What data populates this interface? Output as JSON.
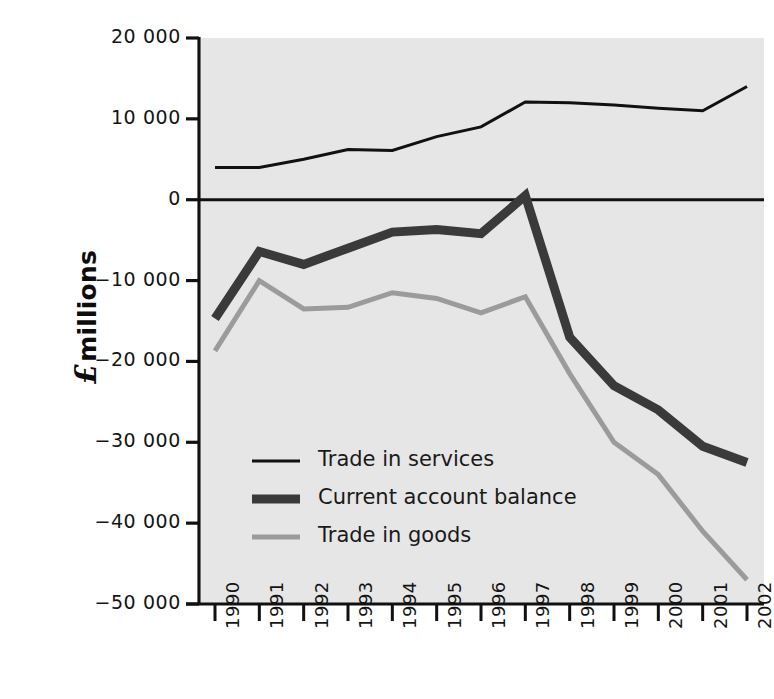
{
  "chart_data": {
    "type": "line",
    "title": "",
    "xlabel": "",
    "ylabel": "£ millions",
    "ylabel_symbol": "£",
    "ylabel_text": "millions",
    "x": [
      "1990",
      "1991",
      "1992",
      "1993",
      "1994",
      "1995",
      "1996",
      "1997",
      "1998",
      "1999",
      "2000",
      "2001",
      "2002"
    ],
    "categories": [
      "1990",
      "1991",
      "1992",
      "1993",
      "1994",
      "1995",
      "1996",
      "1997",
      "1998",
      "1999",
      "2000",
      "2001",
      "2002"
    ],
    "ylim": [
      -50000,
      20000
    ],
    "ytick_values": [
      20000,
      10000,
      0,
      -10000,
      -20000,
      -30000,
      -40000,
      -50000
    ],
    "ytick_labels": [
      "20 000",
      "10 000",
      "0",
      "−10 000",
      "−20 000",
      "−30 000",
      "−40 000",
      "−50 000"
    ],
    "grid": false,
    "legend_position": "inside-lower-left",
    "plot_background": "#e6e6e6",
    "series": [
      {
        "name": "Trade in services",
        "color": "#111111",
        "width": 3,
        "values": [
          4000,
          4000,
          5000,
          6200,
          6100,
          7800,
          9000,
          12100,
          12000,
          11700,
          11300,
          11000,
          14000
        ]
      },
      {
        "name": "Current account balance",
        "color": "#3a3a3a",
        "width": 9,
        "values": [
          -14700,
          -6400,
          -8000,
          -6000,
          -4000,
          -3700,
          -4200,
          500,
          -17000,
          -23000,
          -26000,
          -30500,
          -32500
        ]
      },
      {
        "name": "Trade in goods",
        "color": "#9b9b9b",
        "width": 5,
        "values": [
          -18700,
          -10000,
          -13500,
          -13300,
          -11500,
          -12200,
          -14000,
          -12000,
          -21500,
          -30000,
          -34000,
          -41000,
          -47000
        ]
      }
    ],
    "legend": [
      {
        "label": "Trade in services",
        "color": "#111111",
        "width": 3
      },
      {
        "label": "Current account balance",
        "color": "#3a3a3a",
        "width": 9
      },
      {
        "label": "Trade in goods",
        "color": "#9b9b9b",
        "width": 5
      }
    ]
  }
}
